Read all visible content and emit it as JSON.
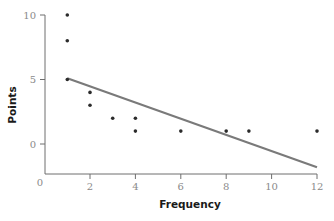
{
  "chart_data": {
    "type": "scatter",
    "title": "",
    "xlabel": "Frequency",
    "ylabel": "Points",
    "xlim": [
      0,
      12
    ],
    "ylim": [
      -2.3,
      10
    ],
    "x_ticks": [
      2,
      4,
      6,
      8,
      10,
      12
    ],
    "y_ticks": [
      0,
      5,
      10
    ],
    "origin_label": "0",
    "grid": false,
    "legend": null,
    "series": [
      {
        "name": "observations",
        "type": "scatter",
        "points": [
          {
            "x": 1,
            "y": 10
          },
          {
            "x": 1,
            "y": 8
          },
          {
            "x": 1,
            "y": 5
          },
          {
            "x": 2,
            "y": 4
          },
          {
            "x": 2,
            "y": 3
          },
          {
            "x": 3,
            "y": 2
          },
          {
            "x": 4,
            "y": 2
          },
          {
            "x": 4,
            "y": 1
          },
          {
            "x": 6,
            "y": 1
          },
          {
            "x": 8,
            "y": 1
          },
          {
            "x": 9,
            "y": 1
          },
          {
            "x": 12,
            "y": 1
          }
        ]
      },
      {
        "name": "regression line",
        "type": "line",
        "points": [
          {
            "x": 1,
            "y": 5.1
          },
          {
            "x": 12,
            "y": -1.8
          }
        ]
      }
    ],
    "colors": {
      "points": "#2b2b2b",
      "line": "#7a7a7a",
      "axis": "#6e6e6e",
      "tick_text": "#8a8a8a"
    }
  }
}
